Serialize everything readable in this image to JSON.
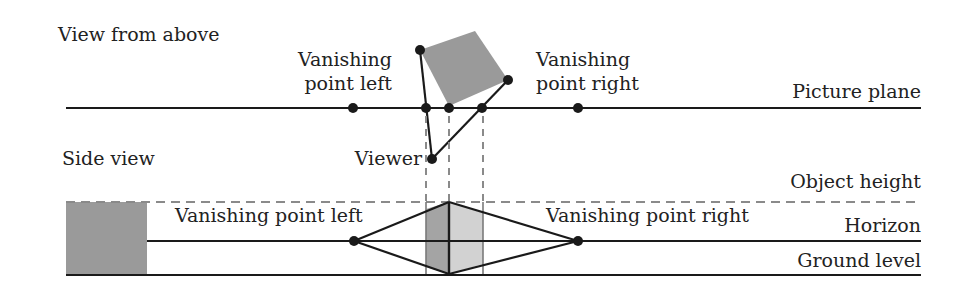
{
  "top_view": {
    "title": "View from above",
    "vp_left_line1": "Vanishing",
    "vp_left_line2": "point left",
    "vp_right_line1": "Vanishing",
    "vp_right_line2": "point right",
    "picture_plane": "Picture plane",
    "viewer": "Viewer"
  },
  "side_view": {
    "title": "Side view",
    "object_height": "Object height",
    "vp_left": "Vanishing point left",
    "vp_right": "Vanishing point right",
    "horizon": "Horizon",
    "ground_level": "Ground level"
  },
  "colors": {
    "line": "#1a1a1a",
    "object_fill": "#9a9a9a",
    "face_dark": "#9e9e9e",
    "face_light": "#cfcfcf",
    "dashed": "#8a8a8a"
  }
}
